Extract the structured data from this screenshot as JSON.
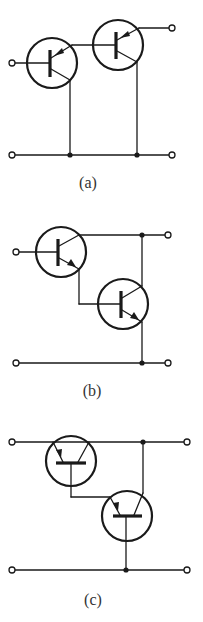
{
  "figure": {
    "panels": [
      {
        "id": "a",
        "label": "(a)",
        "description": "Two PNP transistors in compound connection; emitter of T1 feeds base of T2, collectors tied to common bottom rail"
      },
      {
        "id": "b",
        "label": "(b)",
        "description": "NPN Darlington pair; T1 emitter drives T2 base, collectors tied to top rail"
      },
      {
        "id": "c",
        "label": "(c)",
        "description": "Two transistors drawn with horizontal base bars in cascaded connection; T1 base feeds T2 emitter, T2 base to bottom rail"
      }
    ],
    "colors": {
      "line": "#1a1a1a",
      "background": "#ffffff",
      "label": "#333333"
    }
  }
}
